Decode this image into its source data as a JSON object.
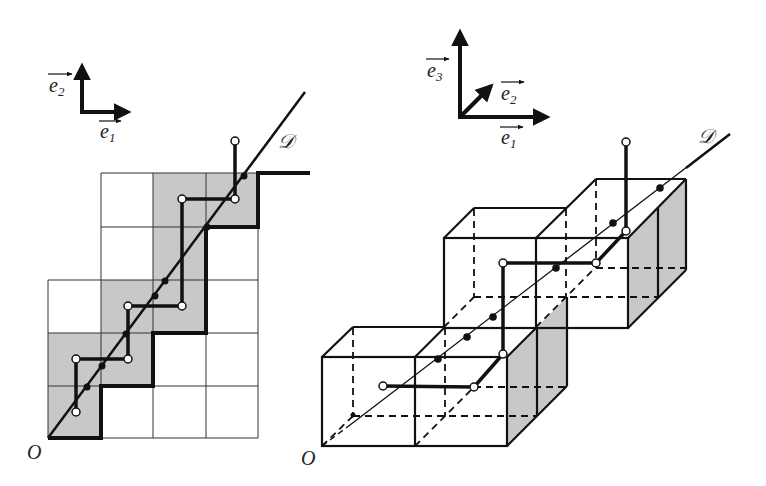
{
  "left_figure": {
    "title": "2D staircase discretization",
    "origin_label": "O",
    "line_label": "𝒟",
    "axes": {
      "e1_label": "e",
      "e1_sub": "1",
      "e2_label": "e",
      "e2_sub": "2"
    },
    "grid": {
      "x_lines": [
        48,
        101,
        153,
        206,
        258
      ],
      "y_lines": [
        438,
        386,
        333,
        280,
        227,
        173
      ],
      "rows": [
        {
          "cols_from": 1,
          "cols_to": 4,
          "shaded": [
            2,
            3
          ]
        },
        {
          "cols_from": 1,
          "cols_to": 4,
          "shaded": [
            2
          ]
        },
        {
          "cols_from": 0,
          "cols_to": 4,
          "shaded": [
            1,
            2
          ]
        },
        {
          "cols_from": 0,
          "cols_to": 4,
          "shaded": [
            0,
            1
          ]
        },
        {
          "cols_from": 0,
          "cols_to": 4,
          "shaded": [
            0
          ]
        }
      ],
      "shade_color": "#c8c8c8"
    },
    "white_points": [
      [
        76,
        412
      ],
      [
        76,
        359
      ],
      [
        128,
        359
      ],
      [
        128,
        306
      ],
      [
        182,
        306
      ],
      [
        182,
        199
      ],
      [
        235,
        199
      ],
      [
        235,
        141
      ]
    ],
    "black_points": [
      [
        87,
        387
      ],
      [
        102,
        366
      ],
      [
        126,
        334
      ],
      [
        155,
        296
      ],
      [
        165,
        281
      ],
      [
        207,
        227
      ],
      [
        232,
        193
      ],
      [
        244,
        176
      ]
    ]
  },
  "right_figure": {
    "title": "3D voxel discretization",
    "origin_label": "O",
    "line_label": "𝒟",
    "axes": {
      "e1_label": "e",
      "e1_sub": "1",
      "e2_label": "e",
      "e2_sub": "2",
      "e3_label": "e",
      "e3_sub": "3"
    },
    "cubes": [
      [
        0,
        0,
        0
      ],
      [
        1,
        0,
        0
      ],
      [
        1,
        1,
        1
      ],
      [
        2,
        1,
        1
      ],
      [
        2,
        2,
        1
      ]
    ],
    "shade_color": "#c8c8c8",
    "white_points": [
      [
        383,
        386
      ],
      [
        474,
        387
      ],
      [
        503,
        354
      ],
      [
        503,
        263
      ],
      [
        596,
        263
      ],
      [
        626,
        231
      ],
      [
        626,
        142
      ]
    ],
    "black_points": [
      [
        353,
        415
      ],
      [
        438,
        359
      ],
      [
        467,
        337
      ],
      [
        493,
        317
      ],
      [
        556,
        268
      ],
      [
        613,
        223
      ],
      [
        660,
        188
      ]
    ]
  },
  "colors": {
    "stroke": "#111111",
    "shade": "#c8c8c8",
    "background": "#ffffff"
  }
}
